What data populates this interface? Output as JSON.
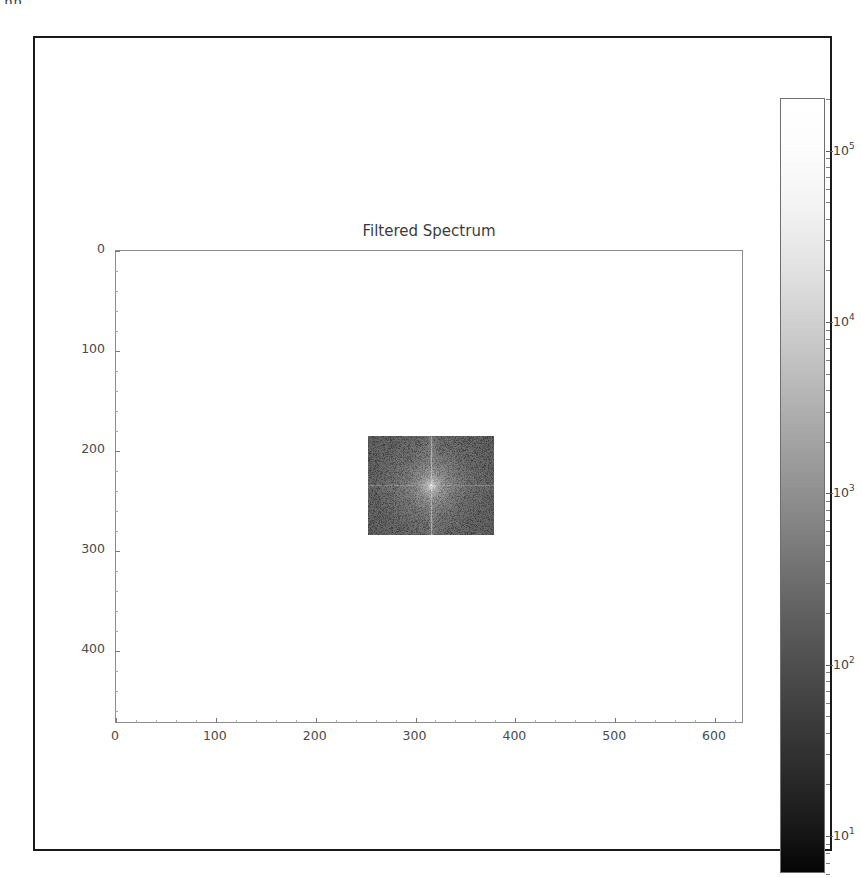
{
  "page": {
    "artifact_text": "pp.",
    "background_color": "#ffffff",
    "frame_color": "#1a1a1a"
  },
  "figure": {
    "title": "Filtered Spectrum",
    "colorbar_label": ""
  },
  "chart_data": {
    "type": "heatmap",
    "title": "Filtered Spectrum",
    "xlabel": "",
    "ylabel": "",
    "xlim": [
      0,
      629
    ],
    "ylim": [
      473,
      0
    ],
    "y_axis_inverted": true,
    "grid": false,
    "legend_position": "right-colorbar",
    "x_ticks": [
      0,
      100,
      200,
      300,
      400,
      500,
      600
    ],
    "x_tick_labels": [
      "0",
      "100",
      "200",
      "300",
      "400",
      "500",
      "600"
    ],
    "y_ticks": [
      0,
      100,
      200,
      300,
      400
    ],
    "y_tick_labels": [
      "0",
      "100",
      "200",
      "300",
      "400"
    ],
    "colormap": "gray",
    "color_scale": "log",
    "colorbar_ticks": [
      10,
      100,
      1000,
      10000,
      100000
    ],
    "colorbar_tick_labels": [
      "10¹",
      "10²",
      "10³",
      "10⁴",
      "10⁵"
    ],
    "colorbar_range": [
      6,
      200000
    ],
    "colorbar_top_color": "#ffffff",
    "colorbar_bottom_color": "#000000",
    "passband_region": {
      "x_start": 252,
      "x_end": 378,
      "y_start": 185,
      "y_end": 284,
      "width": 126,
      "height": 99,
      "peak_value": 150000,
      "peak_x": 315,
      "peak_y": 234,
      "background_value": 120,
      "has_vertical_bright_streak": true,
      "has_horizontal_bright_streak": true
    },
    "outside_passband_value": 0
  },
  "colorbar": {
    "ticks": [
      {
        "label_html": "10⁵",
        "base": "10",
        "exp": "5",
        "value": 100000
      },
      {
        "label_html": "10⁴",
        "base": "10",
        "exp": "4",
        "value": 10000
      },
      {
        "label_html": "10³",
        "base": "10",
        "exp": "3",
        "value": 1000
      },
      {
        "label_html": "10²",
        "base": "10",
        "exp": "2",
        "value": 100
      },
      {
        "label_html": "10¹",
        "base": "10",
        "exp": "1",
        "value": 10
      }
    ]
  }
}
